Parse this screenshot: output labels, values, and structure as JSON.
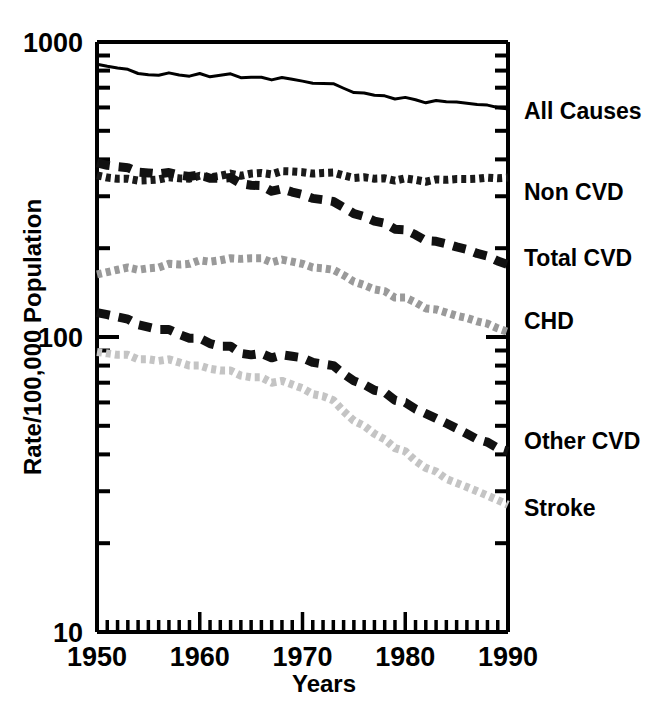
{
  "chart_data": {
    "type": "line",
    "title": "",
    "subtitle": "",
    "xlabel": "Years",
    "ylabel": "Rate/100,000 Population",
    "yscale": "log",
    "xlim": [
      1950,
      1990
    ],
    "ylim": [
      10,
      1000
    ],
    "grid": false,
    "legend_position": "right-of-plot-at-line-end",
    "x_tick_labels": [
      "1950",
      "1960",
      "1970",
      "1980",
      "1990"
    ],
    "x_major_ticks": [
      1950,
      1960,
      1970,
      1980,
      1990
    ],
    "x_minor_tick_interval": 1,
    "y_tick_labels": [
      "1000",
      "100",
      "10"
    ],
    "y_major_ticks": [
      1000,
      100,
      10
    ],
    "x": [
      1950,
      1951,
      1952,
      1953,
      1954,
      1955,
      1956,
      1957,
      1958,
      1959,
      1960,
      1961,
      1962,
      1963,
      1964,
      1965,
      1966,
      1967,
      1968,
      1969,
      1970,
      1971,
      1972,
      1973,
      1974,
      1975,
      1976,
      1977,
      1978,
      1979,
      1980,
      1981,
      1982,
      1983,
      1984,
      1985,
      1986,
      1987,
      1988,
      1989,
      1990
    ],
    "series": [
      {
        "name": "All Causes",
        "label": "All Causes",
        "style": "solid",
        "color": "#000000",
        "width": 3,
        "values": [
          841,
          827,
          816,
          808,
          782,
          774,
          771,
          786,
          773,
          766,
          782,
          762,
          771,
          780,
          757,
          760,
          759,
          744,
          758,
          748,
          737,
          725,
          724,
          722,
          697,
          674,
          672,
          660,
          657,
          641,
          649,
          637,
          622,
          633,
          627,
          626,
          620,
          614,
          611,
          600,
          593
        ]
      },
      {
        "name": "Non CVD",
        "label": "Non CVD",
        "style": "dotted",
        "color": "#1a1a1a",
        "width": 8,
        "values": [
          353,
          347,
          344,
          344,
          339,
          340,
          342,
          348,
          345,
          344,
          352,
          348,
          352,
          358,
          352,
          358,
          360,
          356,
          365,
          364,
          362,
          358,
          360,
          361,
          353,
          346,
          348,
          344,
          345,
          339,
          345,
          341,
          336,
          342,
          341,
          343,
          343,
          344,
          347,
          345,
          347
        ]
      },
      {
        "name": "Total CVD",
        "label": "Total CVD",
        "style": "dashed",
        "color": "#111111",
        "width": 9,
        "values": [
          389,
          382,
          378,
          375,
          362,
          360,
          357,
          361,
          354,
          350,
          355,
          345,
          345,
          347,
          331,
          327,
          326,
          312,
          318,
          310,
          304,
          295,
          292,
          288,
          275,
          262,
          256,
          247,
          243,
          232,
          231,
          222,
          212,
          211,
          207,
          202,
          198,
          192,
          188,
          181,
          176
        ]
      },
      {
        "name": "CHD",
        "label": "CHD",
        "style": "dotted",
        "color": "#9a9a9a",
        "width": 8,
        "values": [
          163,
          166,
          169,
          172,
          169,
          171,
          172,
          177,
          176,
          177,
          182,
          180,
          182,
          185,
          184,
          185,
          185,
          179,
          183,
          180,
          177,
          172,
          171,
          169,
          162,
          154,
          150,
          145,
          143,
          136,
          136,
          131,
          125,
          124,
          121,
          118,
          116,
          113,
          111,
          107,
          104
        ]
      },
      {
        "name": "Other CVD",
        "label": "Other CVD",
        "style": "dashed",
        "color": "#111111",
        "width": 9,
        "values": [
          121,
          119,
          117,
          115,
          110,
          108,
          106,
          106,
          102,
          99,
          99,
          95,
          93,
          93,
          88,
          87,
          88,
          85,
          87,
          86,
          85,
          82,
          81,
          80,
          75,
          71,
          69,
          66,
          65,
          61,
          60,
          57,
          55,
          53,
          51,
          49,
          47,
          45,
          44,
          42,
          41
        ]
      },
      {
        "name": "Stroke",
        "label": "Stroke",
        "style": "dotted",
        "color": "#c4c4c4",
        "width": 8,
        "values": [
          89,
          88,
          87,
          87,
          84,
          84,
          83,
          84,
          82,
          80,
          80,
          78,
          77,
          77,
          74,
          73,
          73,
          70,
          71,
          69,
          67,
          64,
          63,
          61,
          56,
          52,
          50,
          47,
          45,
          42,
          41,
          38,
          36,
          35,
          33,
          32,
          31,
          30,
          29,
          28,
          27
        ]
      }
    ]
  },
  "axes": {
    "y_label": "Rate/100,000 Population",
    "x_label": "Years",
    "y_ticks": [
      {
        "value": "1000"
      },
      {
        "value": "100"
      },
      {
        "value": "10"
      }
    ],
    "x_ticks": [
      {
        "value": "1950"
      },
      {
        "value": "1960"
      },
      {
        "value": "1970"
      },
      {
        "value": "1980"
      },
      {
        "value": "1990"
      }
    ]
  },
  "series_labels": [
    {
      "text": "All Causes"
    },
    {
      "text": "Non CVD"
    },
    {
      "text": "Total CVD"
    },
    {
      "text": "CHD"
    },
    {
      "text": "Other CVD"
    },
    {
      "text": "Stroke"
    }
  ]
}
